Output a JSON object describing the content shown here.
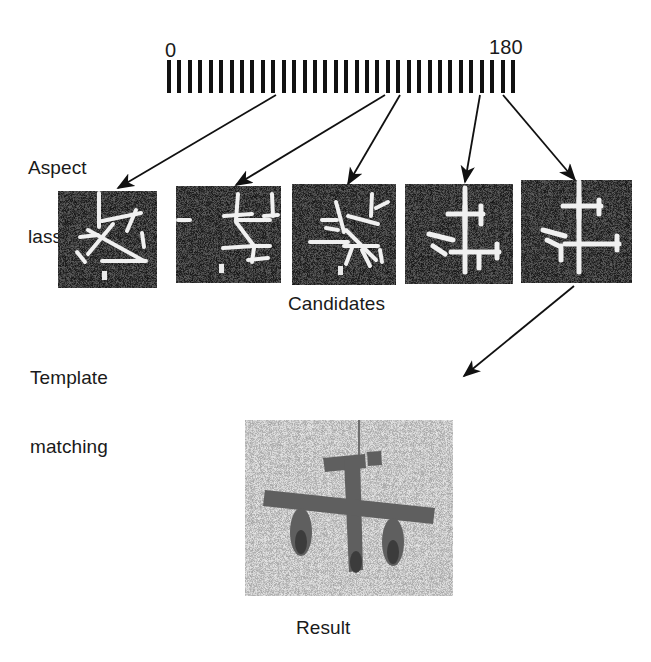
{
  "figure": {
    "background_color": "#ffffff",
    "ink_color": "#1a1a1a"
  },
  "scale": {
    "name": "aspect-angle-scale",
    "min_label": "0",
    "max_label": "180",
    "units": "degrees",
    "tick_count": 34,
    "tick_color": "#111111"
  },
  "labels": {
    "aspect_classification_line1": "Aspect",
    "aspect_classification_line2": "lassification",
    "template_matching_line1": "Template",
    "template_matching_line2": "matching",
    "candidates": "Candidates",
    "result": "Result"
  },
  "candidates": {
    "count": 5,
    "caption": "Candidates",
    "background_color": "#3a3a3a",
    "feature_color": "#f2f2f2",
    "items": [
      {
        "index": 1,
        "name": "candidate-thumbnail-1",
        "source_tick": 26
      },
      {
        "index": 2,
        "name": "candidate-thumbnail-2",
        "source_tick": 55
      },
      {
        "index": 3,
        "name": "candidate-thumbnail-3",
        "source_tick": 56
      },
      {
        "index": 4,
        "name": "candidate-thumbnail-4",
        "source_tick": 76
      },
      {
        "index": 5,
        "name": "candidate-thumbnail-5",
        "source_tick": 82
      }
    ]
  },
  "result": {
    "caption": "Result",
    "background_color": "#c9c9c9",
    "object_color": "#5d5d5d",
    "depicts": "aircraft-silhouette"
  },
  "arrows": {
    "count": 6,
    "color": "#111111",
    "scale_to_candidates": 5,
    "candidate_to_result": 1
  }
}
